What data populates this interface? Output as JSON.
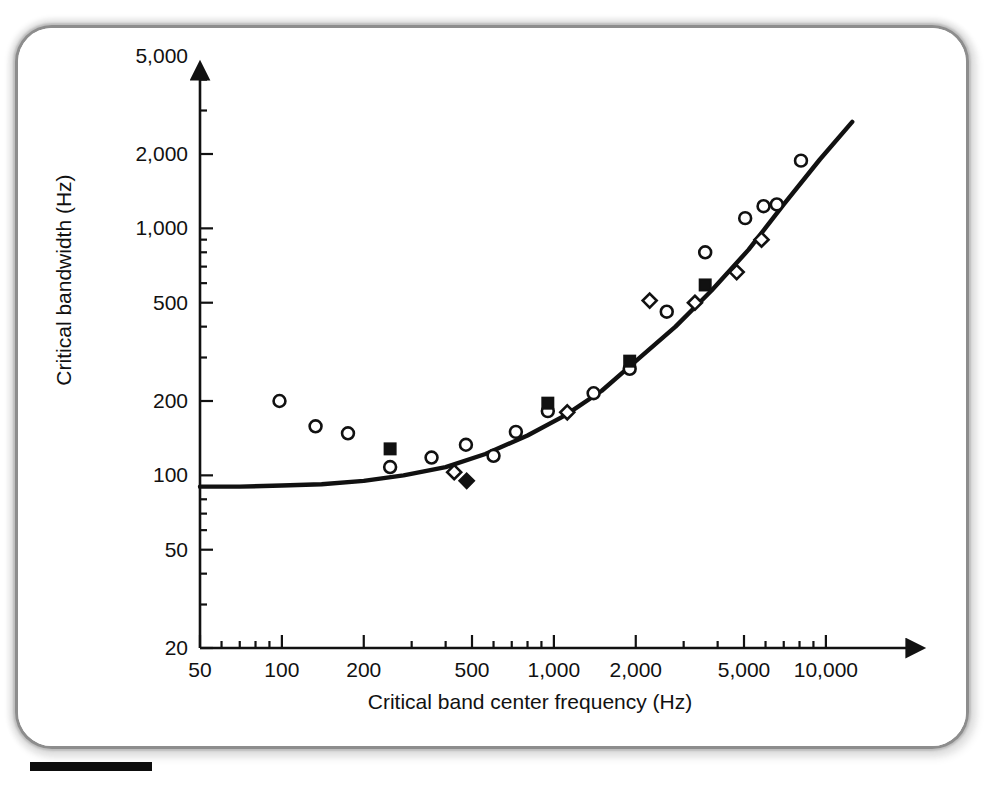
{
  "figure": {
    "scale_bar_present": true,
    "frame_style": "rounded-soft-gray-border"
  },
  "chart_data": {
    "type": "scatter",
    "title": "",
    "subtitle": "",
    "xlabel": "Critical band center frequency (Hz)",
    "ylabel": "Critical bandwidth (Hz)",
    "xscale": "log",
    "yscale": "log",
    "xlim": [
      45,
      16000
    ],
    "ylim": [
      20,
      9000
    ],
    "grid": false,
    "legend_position": "none",
    "xticks": [
      50,
      100,
      200,
      500,
      1000,
      2000,
      5000,
      10000
    ],
    "xtick_labels": [
      "50",
      "100",
      "200",
      "500",
      "1,000",
      "2,000",
      "5,000",
      "10,000"
    ],
    "yticks": [
      20,
      50,
      100,
      200,
      500,
      1000,
      2000,
      5000
    ],
    "ytick_labels": [
      "20",
      "50",
      "100",
      "200",
      "500",
      "1,000",
      "2,000",
      "5,000"
    ],
    "annotations": [],
    "series": [
      {
        "name": "open-circle",
        "marker": "open circle",
        "marker_fill": "#ffffff",
        "marker_edge": "#111111",
        "points": [
          [
            98,
            200
          ],
          [
            133,
            158
          ],
          [
            175,
            148
          ],
          [
            250,
            108
          ],
          [
            355,
            118
          ],
          [
            475,
            133
          ],
          [
            600,
            120
          ],
          [
            725,
            150
          ],
          [
            950,
            182
          ],
          [
            1400,
            215
          ],
          [
            1900,
            270
          ],
          [
            2600,
            460
          ],
          [
            3600,
            800
          ],
          [
            5050,
            1100
          ],
          [
            5900,
            1230
          ],
          [
            6600,
            1250
          ],
          [
            8100,
            1880
          ]
        ]
      },
      {
        "name": "open-diamond",
        "marker": "open diamond",
        "marker_fill": "#ffffff",
        "marker_edge": "#111111",
        "points": [
          [
            430,
            103
          ],
          [
            1120,
            180
          ],
          [
            2250,
            510
          ],
          [
            3300,
            500
          ],
          [
            4700,
            665
          ],
          [
            5800,
            900
          ]
        ]
      },
      {
        "name": "filled-square",
        "marker": "filled square",
        "marker_fill": "#111111",
        "marker_edge": "#111111",
        "points": [
          [
            250,
            128
          ],
          [
            950,
            196
          ],
          [
            1900,
            290
          ],
          [
            3600,
            590
          ]
        ]
      },
      {
        "name": "filled-diamond",
        "marker": "filled diamond",
        "marker_fill": "#111111",
        "marker_edge": "#111111",
        "points": [
          [
            478,
            95
          ]
        ]
      }
    ],
    "fitted_curve": {
      "name": "critical bandwidth function",
      "stroke": "#111111",
      "points": [
        [
          50,
          90
        ],
        [
          70,
          90
        ],
        [
          100,
          91
        ],
        [
          140,
          92
        ],
        [
          200,
          95
        ],
        [
          280,
          100
        ],
        [
          400,
          108
        ],
        [
          560,
          122
        ],
        [
          800,
          145
        ],
        [
          1100,
          175
        ],
        [
          1500,
          220
        ],
        [
          2000,
          290
        ],
        [
          2800,
          400
        ],
        [
          3800,
          560
        ],
        [
          5200,
          820
        ],
        [
          7000,
          1250
        ],
        [
          9500,
          1900
        ],
        [
          12500,
          2700
        ]
      ]
    }
  }
}
